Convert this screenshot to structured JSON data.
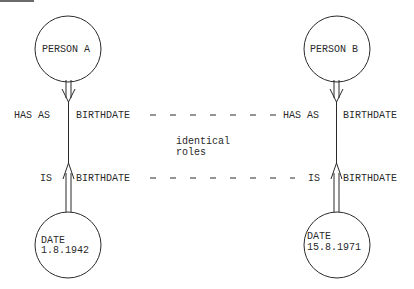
{
  "diagram": {
    "nodes": {
      "person_a": {
        "label": "PERSON A"
      },
      "person_b": {
        "label": "PERSON B"
      },
      "date_a": {
        "line1": "DATE",
        "line2": "1.8.1942"
      },
      "date_b": {
        "line1": "DATE",
        "line2": "15.8.1971"
      }
    },
    "roles": {
      "left_has_as": "HAS AS",
      "left_has_as_role": "BIRTHDATE",
      "left_is": "IS",
      "left_is_role": "BIRTHDATE",
      "right_has_as": "HAS AS",
      "right_has_as_role": "BIRTHDATE",
      "right_is": "IS",
      "right_is_role": "BIRTHDATE"
    },
    "annotation": {
      "line1": "identical",
      "line2": "roles"
    },
    "colors": {
      "ink": "#2a2a2a",
      "background": "#ffffff"
    }
  }
}
